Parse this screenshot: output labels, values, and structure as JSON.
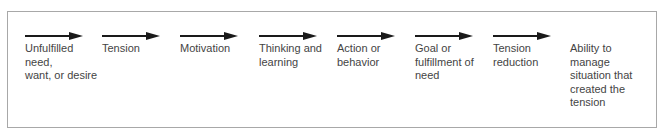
{
  "diagram": {
    "type": "process-flow",
    "steps": [
      {
        "label": "Unfulfilled need,\nwant, or desire",
        "x": 17,
        "arrow": true
      },
      {
        "label": "Tension",
        "x": 94,
        "arrow": true
      },
      {
        "label": "Motivation",
        "x": 172,
        "arrow": true
      },
      {
        "label": "Thinking and\nlearning",
        "x": 251,
        "arrow": true
      },
      {
        "label": "Action or\nbehavior",
        "x": 329,
        "arrow": true
      },
      {
        "label": "Goal or\nfulfillment of\nneed",
        "x": 407,
        "arrow": true
      },
      {
        "label": "Tension\nreduction",
        "x": 485,
        "arrow": true
      },
      {
        "label": "Ability to\nmanage\nsituation that\ncreated the\ntension",
        "x": 562,
        "arrow": false
      }
    ],
    "colors": {
      "arrow": "#1a1a1a",
      "text": "#444444",
      "border": "#a8a8a8"
    }
  }
}
